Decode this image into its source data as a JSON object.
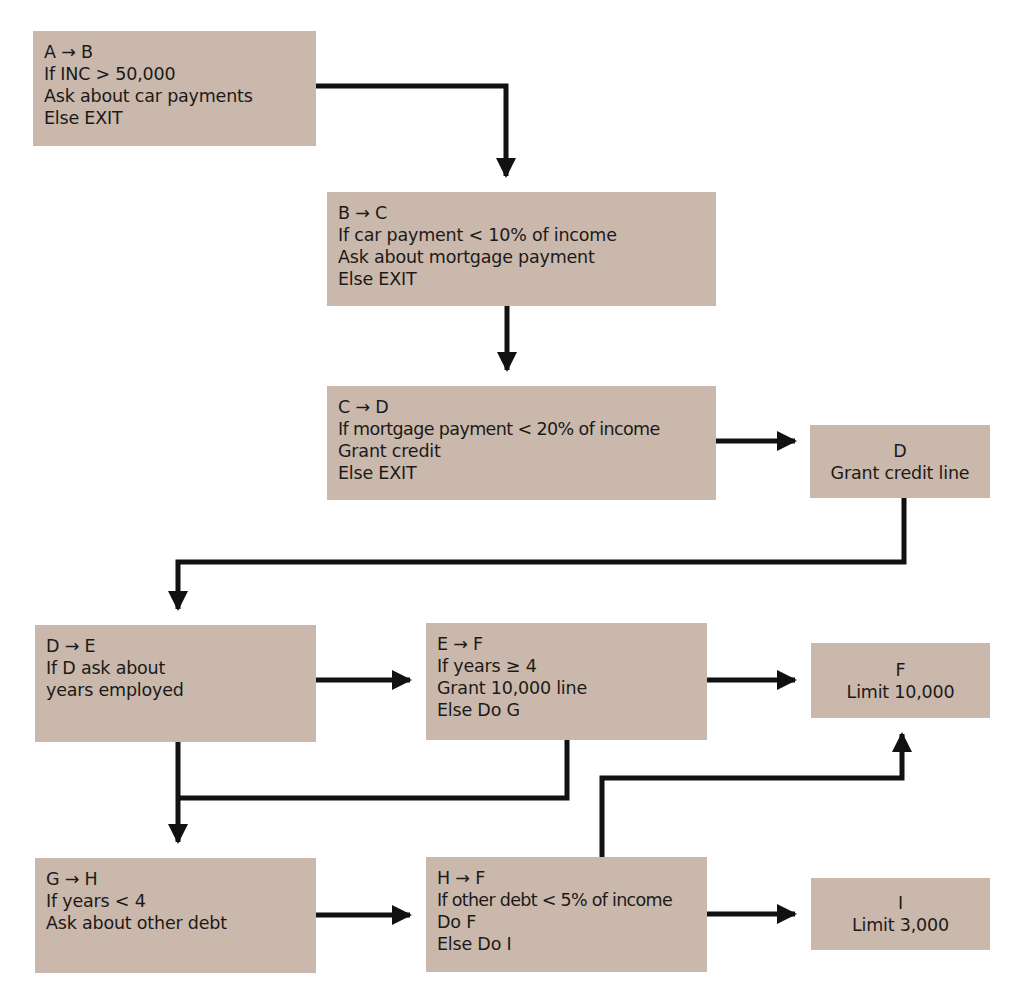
{
  "diagram": {
    "type": "flowchart",
    "colors": {
      "box_fill": "#c9b8ab",
      "text": "#1c1a19",
      "connector": "#111111",
      "background": "#ffffff"
    },
    "nodes": {
      "ab": {
        "lines": [
          "A → B",
          "If INC  >  50,000",
          "Ask about car payments",
          "Else EXIT"
        ]
      },
      "bc": {
        "lines": [
          "B → C",
          "If car payment  < 10% of income",
          "Ask about mortgage payment",
          "Else EXIT"
        ]
      },
      "cd": {
        "lines": [
          "C → D",
          "If mortgage payment < 20% of income",
          "Grant credit",
          "Else EXIT"
        ]
      },
      "d": {
        "lines": [
          "D",
          "Grant credit line"
        ]
      },
      "de": {
        "lines": [
          "D → E",
          "If D ask about",
          "years employed"
        ]
      },
      "ef": {
        "lines": [
          "E → F",
          "If years  ≥  4",
          "Grant 10,000 line",
          "Else Do G"
        ]
      },
      "f": {
        "lines": [
          "F",
          "Limit 10,000"
        ]
      },
      "gh": {
        "lines": [
          "G → H",
          "If years  <  4",
          "Ask about other debt"
        ]
      },
      "hf": {
        "lines": [
          "H → F",
          "If other debt < 5% of income",
          "Do F",
          "Else Do I"
        ]
      },
      "i": {
        "lines": [
          "I",
          "Limit 3,000"
        ]
      }
    },
    "edges": [
      {
        "from": "A → B",
        "to": "B → C"
      },
      {
        "from": "B → C",
        "to": "C → D"
      },
      {
        "from": "C → D",
        "to": "D"
      },
      {
        "from": "D",
        "to": "D → E"
      },
      {
        "from": "D → E",
        "to": "E → F"
      },
      {
        "from": "E → F",
        "to": "F"
      },
      {
        "from": "D → E",
        "to": "G → H"
      },
      {
        "from": "E → F",
        "to": "G → H"
      },
      {
        "from": "G → H",
        "to": "H → F"
      },
      {
        "from": "H → F",
        "to": "I"
      },
      {
        "from": "H → F",
        "to": "F"
      }
    ]
  }
}
